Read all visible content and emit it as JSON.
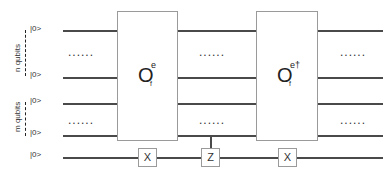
{
  "registers": {
    "n_label": "n qubits",
    "m_label": "m qubits"
  },
  "kets": [
    "|0>",
    "|0>",
    "|0>",
    "|0>",
    "|0>"
  ],
  "ellipsis": "......",
  "operators": {
    "oracle": {
      "base": "O",
      "sup": "e",
      "sub": "f"
    },
    "oracle_dagger": {
      "base": "O",
      "sup": "e†",
      "sub": "f"
    }
  },
  "ancilla_gates": [
    "X",
    "Z",
    "X"
  ]
}
